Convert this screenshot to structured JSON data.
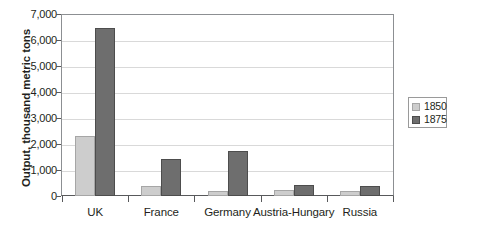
{
  "chart_data": {
    "type": "bar",
    "title": "",
    "xlabel": "",
    "ylabel": "Output, thousand metric tons",
    "categories": [
      "UK",
      "France",
      "Germany",
      "Austria-Hungary",
      "Russia"
    ],
    "series": [
      {
        "name": "1850",
        "color": "#cdcdcd",
        "values": [
          2300,
          400,
          180,
          230,
          190
        ]
      },
      {
        "name": "1875",
        "color": "#6e6e6e",
        "values": [
          6450,
          1430,
          1720,
          420,
          390
        ]
      }
    ],
    "ylim": [
      0,
      7000
    ],
    "ytick_values": [
      7000,
      6000,
      5000,
      4000,
      3000,
      2000,
      1000,
      0
    ],
    "ytick_labels": [
      "7,000",
      "6,000",
      "5,000",
      "4,000",
      "3,000",
      "2,000",
      "1,000",
      "0"
    ],
    "grid": true,
    "grid_axis": "y",
    "legend_position": "right",
    "legend_entries": [
      "1850",
      "1875"
    ]
  },
  "caption": {
    "fragment": ""
  }
}
